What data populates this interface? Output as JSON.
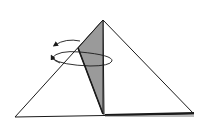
{
  "diagram": {
    "type": "origami-fold-step",
    "colors": {
      "background": "#ffffff",
      "outline": "#1a1a1a",
      "flap_fill": "#9a9a9a",
      "paper_fill": "#ffffff"
    },
    "shapes": {
      "main_triangle": {
        "apex": [
          103,
          20
        ],
        "left": [
          15,
          117
        ],
        "right": [
          194,
          114
        ]
      },
      "shaded_flap": {
        "apex": [
          103,
          20
        ],
        "outer": [
          78,
          48
        ],
        "bottom": [
          103,
          115
        ]
      },
      "arrow": {
        "kind": "rotate",
        "center": [
          82,
          60
        ]
      }
    }
  }
}
